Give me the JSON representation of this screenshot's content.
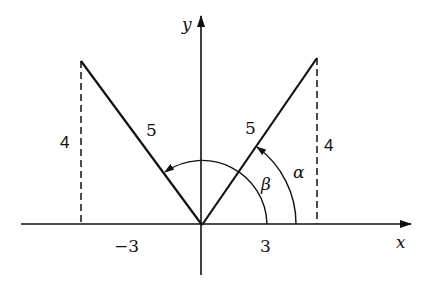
{
  "diagram": {
    "axes": {
      "x_label": "x",
      "y_label": "y"
    },
    "tick_labels": {
      "neg_three": "−3",
      "pos_three": "3"
    },
    "segments": {
      "left_length": "5",
      "right_length": "5",
      "left_height": "4",
      "right_height": "4"
    },
    "points": {
      "left": [
        -3,
        4
      ],
      "right": [
        3,
        4
      ],
      "origin": [
        0,
        0
      ]
    },
    "angles": {
      "alpha": "α",
      "beta": "β"
    },
    "colors": {
      "ink": "#111111",
      "background": "#ffffff"
    }
  }
}
